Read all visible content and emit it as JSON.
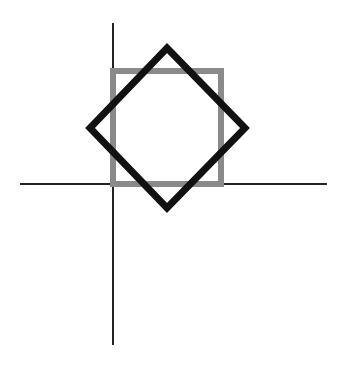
{
  "diagram": {
    "colors": {
      "background": "#ffffff",
      "axes": "#222222",
      "square": "#8a8a8a",
      "diamond": "#111111"
    },
    "axes": {
      "horizontal": {
        "x1": 20,
        "y1": 184,
        "x2": 327,
        "y2": 184,
        "stroke_width": 2
      },
      "vertical": {
        "x1": 113,
        "y1": 23,
        "x2": 113,
        "y2": 345,
        "stroke_width": 2
      }
    },
    "square": {
      "x": 113,
      "y": 71,
      "width": 108,
      "height": 113,
      "stroke_width": 6
    },
    "diamond": {
      "points": "167,48 245,128 167,208 90,128",
      "stroke_width": 7
    }
  }
}
